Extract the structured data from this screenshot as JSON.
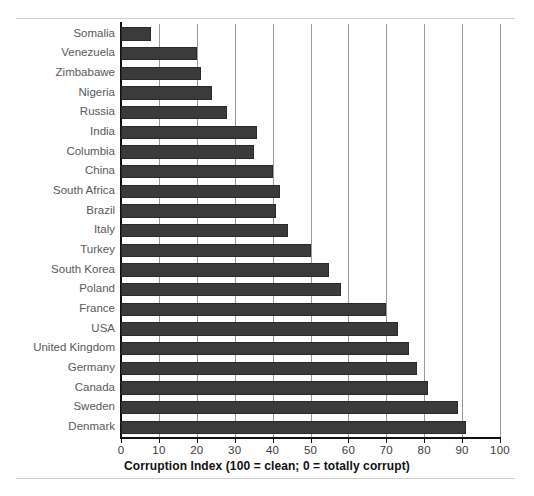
{
  "figure": {
    "background": "#fefefe",
    "bar_color": "#3b3b3b",
    "grid_color": "#9a9a9a",
    "axis_color": "#111111",
    "label_color": "#5a5a5a",
    "rule_color": "#cfcfcf"
  },
  "chart_data": {
    "type": "bar",
    "orientation": "horizontal",
    "title": "",
    "xlabel": "Corruption Index (100 = clean; 0 = totally corrupt)",
    "ylabel": "",
    "xlim": [
      0,
      100
    ],
    "xticks": [
      0,
      10,
      20,
      30,
      40,
      50,
      60,
      70,
      80,
      90,
      100
    ],
    "grid": "vertical",
    "legend": "none",
    "categories": [
      "Somalia",
      "Venezuela",
      "Zimbabawe",
      "Nigeria",
      "Russia",
      "India",
      "Columbia",
      "China",
      "South Africa",
      "Brazil",
      "Italy",
      "Turkey",
      "South Korea",
      "Poland",
      "France",
      "USA",
      "United Kingdom",
      "Germany",
      "Canada",
      "Sweden",
      "Denmark"
    ],
    "values": [
      8,
      20,
      21,
      24,
      28,
      36,
      35,
      40,
      42,
      41,
      44,
      50,
      55,
      58,
      70,
      73,
      76,
      78,
      81,
      89,
      91
    ]
  }
}
